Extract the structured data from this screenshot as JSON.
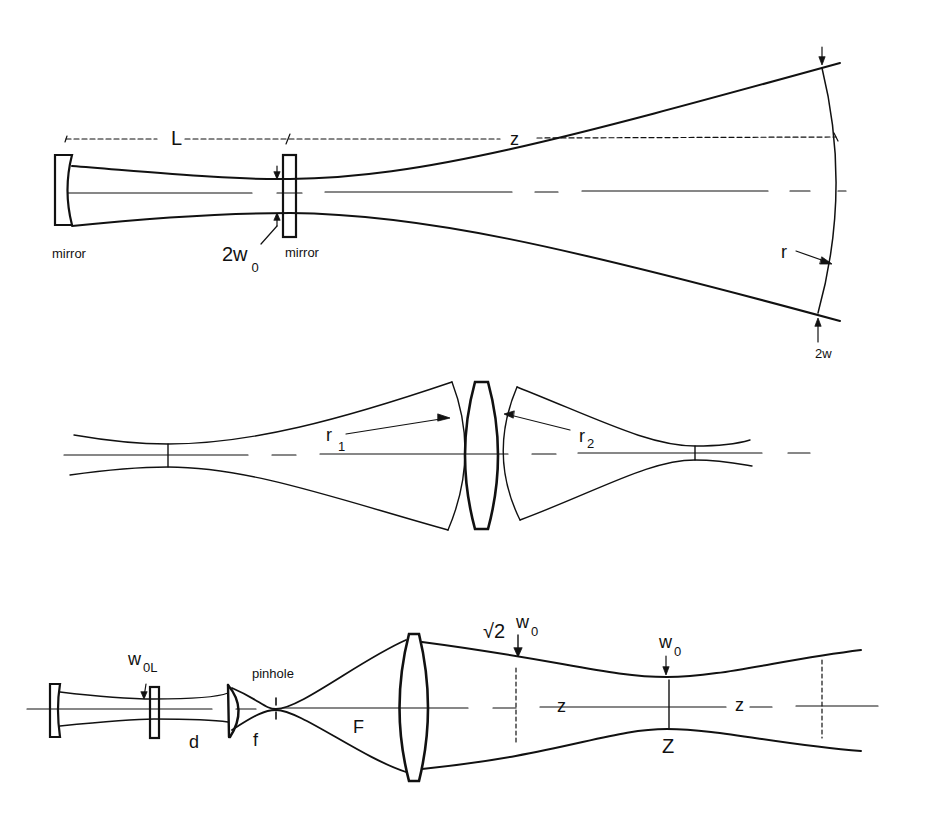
{
  "figure": {
    "background": "#ffffff",
    "stroke_color": "#111111"
  },
  "panel_top": {
    "title": "Resonator output beam expansion",
    "labels": {
      "L": "L",
      "z": "z",
      "mirror_left": "mirror",
      "mirror_right": "mirror",
      "waist_main": "2w",
      "waist_sub": "0",
      "radius": "r",
      "width": "2w"
    }
  },
  "panel_middle": {
    "title": "Lens transforming Gaussian beam",
    "labels": {
      "r1_main": "r",
      "r1_sub": "1",
      "r2_main": "r",
      "r2_sub": "2"
    }
  },
  "panel_bottom": {
    "title": "Spatial filter and beam expander",
    "labels": {
      "w0L_main": "w",
      "w0L_sub": "0L",
      "d": "d",
      "f": "f",
      "pinhole": "pinhole",
      "F": "F",
      "sqrt2": "√2",
      "w0a_main": "w",
      "w0a_sub": "0",
      "w0b_main": "w",
      "w0b_sub": "0",
      "z_left": "z",
      "z_right": "z",
      "Z": "Z"
    }
  }
}
